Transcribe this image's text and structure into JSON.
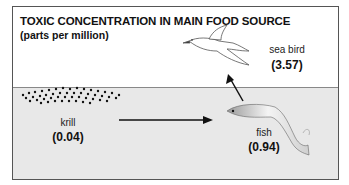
{
  "title": "TOXIC CONCENTRATION IN MAIN FOOD SOURCE",
  "subtitle": "(parts per million)",
  "organisms": [
    {
      "name": "krill",
      "value": "(0.04)"
    },
    {
      "name": "fish",
      "value": "(0.94)"
    },
    {
      "name": "sea bird",
      "value": "(3.57)"
    }
  ],
  "colors": {
    "water": "#e8e8e8",
    "border": "#555555",
    "text": "#111111"
  }
}
